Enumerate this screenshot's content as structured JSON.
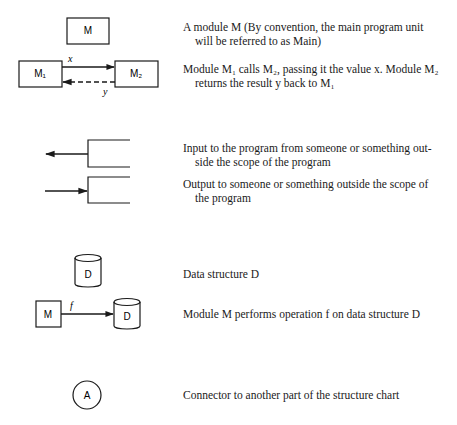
{
  "legend": {
    "module": {
      "symbol_label": "M",
      "line1": "A module M (By convention, the main program unit",
      "line2": "will be referred to as Main)"
    },
    "call": {
      "caller_label": "M₁",
      "callee_label": "M₂",
      "param_label": "x",
      "return_label": "y",
      "line1": "Module M₁ calls M₂, passing it the value x. Module M₂",
      "line2": "returns the result y back to M₁"
    },
    "input": {
      "line1": "Input to the program from someone or something out-",
      "line2": "side the scope of the program"
    },
    "output": {
      "line1": "Output to someone or something outside the scope of",
      "line2": "the program"
    },
    "data_structure": {
      "symbol_label": "D",
      "line1": "Data structure D"
    },
    "operation": {
      "module_label": "M",
      "op_label": "f",
      "ds_label": "D",
      "line1": "Module M performs operation f on data structure D"
    },
    "connector": {
      "symbol_label": "A",
      "line1": "Connector to another part of the structure chart"
    }
  },
  "colors": {
    "ink": "#1a1a1a",
    "background": "#ffffff"
  }
}
